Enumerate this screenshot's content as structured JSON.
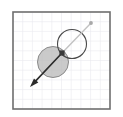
{
  "figure": {
    "title": "",
    "background_color": "#ffffff",
    "width": 123,
    "height": 117
  },
  "plot_frame": {
    "name": "plot-border",
    "x": 13,
    "y": 12,
    "width": 97,
    "height": 97,
    "stroke_color": "#6e6e6e",
    "stroke_width": 1.6,
    "fill_color": "#ffffff"
  },
  "grid": {
    "visible": true,
    "line_color": "#e9e9ee",
    "line_width": 0.6,
    "cell_size": 9.7,
    "columns": 10,
    "rows": 10
  },
  "shapes": {
    "filled_circle": {
      "label": "filled-circle",
      "center_x": 53,
      "center_y": 62,
      "radius": 15.5,
      "fill_color": "#b8b8b8",
      "fill_opacity": 0.75,
      "stroke_color": "#8a8a8a",
      "stroke_width": 1.0
    },
    "outlined_circle": {
      "label": "outlined-circle",
      "center_x": 72,
      "center_y": 44,
      "radius": 14.5,
      "fill_color": "none",
      "stroke_color": "#4a4a4a",
      "stroke_width": 1.1
    },
    "center_marker": {
      "label": "center-marker",
      "x": 62,
      "y": 53,
      "size": 5.2,
      "fill_color": "#3a3a3a"
    }
  },
  "vectors": {
    "arrow": {
      "label": "direction-arrow",
      "start_x": 62,
      "start_y": 53,
      "end_x": 30,
      "end_y": 87,
      "stroke_color": "#2b2b2b",
      "stroke_width": 1.6,
      "head_length": 9,
      "head_width": 6
    },
    "ray": {
      "label": "guide-ray",
      "start_x": 62,
      "start_y": 53,
      "end_x": 91,
      "end_y": 23,
      "stroke_color": "#c2c2c2",
      "stroke_width": 1.4
    },
    "ray_endpoint": {
      "label": "ray-endpoint-dot",
      "x": 91,
      "y": 23,
      "radius": 1.9,
      "fill_color": "#a8a8a8"
    }
  }
}
